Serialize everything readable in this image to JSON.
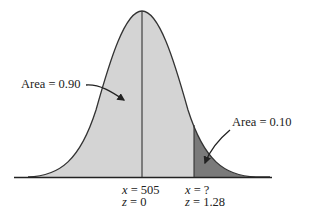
{
  "diagram": {
    "type": "normal-distribution-curve",
    "colors": {
      "left_area_fill": "#d4d4d4",
      "right_tail_fill": "#7a7a7a",
      "curve_stroke": "#333333",
      "background": "#ffffff"
    },
    "annotations": {
      "left_area": {
        "label": "Area = 0.90"
      },
      "right_area": {
        "label": "Area = 0.10"
      }
    },
    "axis_labels": {
      "mean": {
        "x_var": "x",
        "x_value": "= 505",
        "z_var": "z",
        "z_value": "= 0"
      },
      "cutoff": {
        "x_var": "x",
        "x_value": "= ?",
        "z_var": "z",
        "z_value": "= 1.28"
      }
    }
  }
}
